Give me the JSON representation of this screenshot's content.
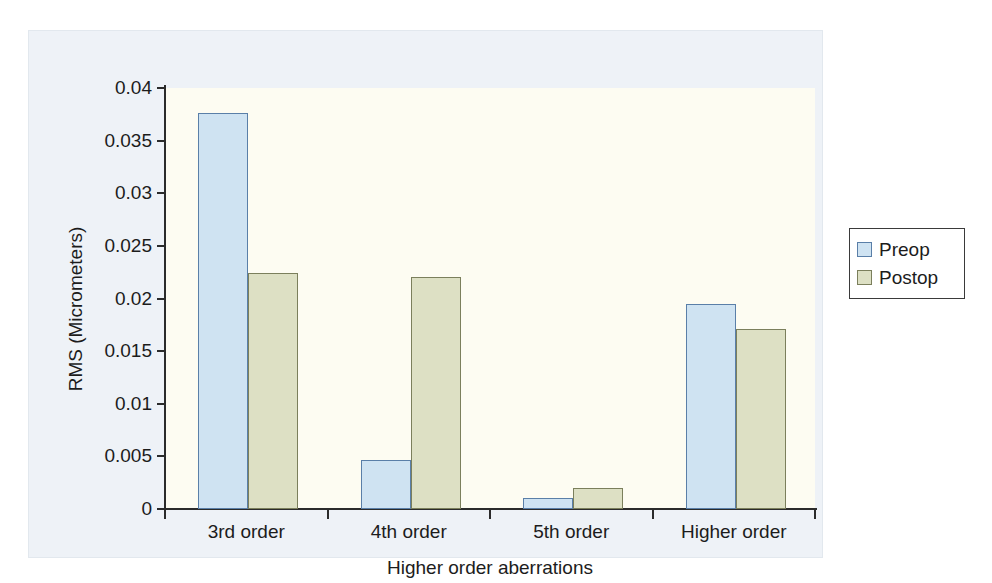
{
  "chart_data": {
    "type": "bar",
    "title": "",
    "subtitle": "",
    "xlabel": "Higher order aberrations",
    "ylabel": "RMS (Micrometers)",
    "categories": [
      "3rd order",
      "4th order",
      "5th order",
      "Higher order"
    ],
    "series": [
      {
        "name": "Preop",
        "color": "#cfe3f2",
        "border": "#5a7fa8",
        "values": [
          0.0376,
          0.0047,
          0.001,
          0.0195
        ]
      },
      {
        "name": "Postop",
        "color": "#dde0c4",
        "border": "#7b7f5c",
        "values": [
          0.0224,
          0.022,
          0.002,
          0.0171
        ]
      }
    ],
    "ylim": [
      0,
      0.04
    ],
    "ytick_values": [
      0,
      0.005,
      0.01,
      0.015,
      0.02,
      0.025,
      0.03,
      0.035,
      0.04
    ],
    "ytick_labels": [
      "0",
      "0.005",
      "0.01",
      "0.015",
      "0.02",
      "0.025",
      "0.03",
      "0.035",
      "0.04"
    ],
    "grid": false,
    "legend_position": "right",
    "legend_entries": [
      "Preop",
      "Postop"
    ]
  },
  "legend": {
    "items": [
      {
        "label": "Preop"
      },
      {
        "label": "Postop"
      }
    ]
  },
  "colors": {
    "preop_fill": "#cfe3f2",
    "preop_border": "#5a7fa8",
    "postop_fill": "#dde0c4",
    "postop_border": "#7b7f5c",
    "plot_background": "#fdfcf2",
    "figure_background": "#eef2f7",
    "axis": "#2b2b2b"
  }
}
